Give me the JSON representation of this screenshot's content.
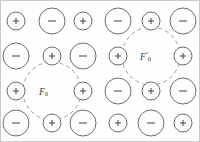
{
  "figure": {
    "background_color": "#fefefe",
    "border_color": "#c9c9c9",
    "ion_stroke_color": "#5b5b5b",
    "shell_stroke_color": "#8e8e8e",
    "label_color": "#3a3a3a",
    "width": 200,
    "height": 142
  },
  "lattice": {
    "columns_x": [
      15,
      51,
      82,
      117,
      150,
      182
    ],
    "rows_y": [
      20,
      55,
      90,
      122
    ],
    "radius_positive": 9,
    "radius_negative": 13,
    "sign_positive": "+",
    "sign_negative": "−",
    "ions": [
      {
        "row": 0,
        "col": 0,
        "charge": "positive",
        "cx": 15,
        "cy": 20,
        "r": 9,
        "sign": "+"
      },
      {
        "row": 0,
        "col": 1,
        "charge": "negative",
        "cx": 51,
        "cy": 20,
        "r": 13,
        "sign": "−"
      },
      {
        "row": 0,
        "col": 2,
        "charge": "positive",
        "cx": 82,
        "cy": 20,
        "r": 9,
        "sign": "+"
      },
      {
        "row": 0,
        "col": 3,
        "charge": "negative",
        "cx": 117,
        "cy": 20,
        "r": 13,
        "sign": "−"
      },
      {
        "row": 0,
        "col": 4,
        "charge": "positive",
        "cx": 150,
        "cy": 20,
        "r": 9,
        "sign": "+"
      },
      {
        "row": 0,
        "col": 5,
        "charge": "negative",
        "cx": 182,
        "cy": 20,
        "r": 13,
        "sign": "−"
      },
      {
        "row": 1,
        "col": 0,
        "charge": "negative",
        "cx": 15,
        "cy": 55,
        "r": 13,
        "sign": "−"
      },
      {
        "row": 1,
        "col": 1,
        "charge": "positive",
        "cx": 51,
        "cy": 55,
        "r": 9,
        "sign": "+"
      },
      {
        "row": 1,
        "col": 2,
        "charge": "negative",
        "cx": 82,
        "cy": 55,
        "r": 13,
        "sign": "−"
      },
      {
        "row": 1,
        "col": 3,
        "charge": "positive",
        "cx": 117,
        "cy": 55,
        "r": 9,
        "sign": "+"
      },
      {
        "row": 1,
        "col": 5,
        "charge": "positive",
        "cx": 182,
        "cy": 55,
        "r": 9,
        "sign": "+"
      },
      {
        "row": 2,
        "col": 0,
        "charge": "positive",
        "cx": 15,
        "cy": 90,
        "r": 9,
        "sign": "+"
      },
      {
        "row": 2,
        "col": 2,
        "charge": "positive",
        "cx": 82,
        "cy": 90,
        "r": 9,
        "sign": "+"
      },
      {
        "row": 2,
        "col": 3,
        "charge": "negative",
        "cx": 117,
        "cy": 90,
        "r": 13,
        "sign": "−"
      },
      {
        "row": 2,
        "col": 4,
        "charge": "positive",
        "cx": 150,
        "cy": 90,
        "r": 9,
        "sign": "+"
      },
      {
        "row": 2,
        "col": 5,
        "charge": "negative",
        "cx": 182,
        "cy": 90,
        "r": 13,
        "sign": "−"
      },
      {
        "row": 3,
        "col": 0,
        "charge": "negative",
        "cx": 15,
        "cy": 122,
        "r": 13,
        "sign": "−"
      },
      {
        "row": 3,
        "col": 1,
        "charge": "positive",
        "cx": 51,
        "cy": 122,
        "r": 9,
        "sign": "+"
      },
      {
        "row": 3,
        "col": 2,
        "charge": "negative",
        "cx": 82,
        "cy": 122,
        "r": 13,
        "sign": "−"
      },
      {
        "row": 3,
        "col": 3,
        "charge": "positive",
        "cx": 117,
        "cy": 122,
        "r": 9,
        "sign": "+"
      },
      {
        "row": 3,
        "col": 4,
        "charge": "negative",
        "cx": 150,
        "cy": 122,
        "r": 13,
        "sign": "−"
      },
      {
        "row": 3,
        "col": 5,
        "charge": "positive",
        "cx": 182,
        "cy": 122,
        "r": 9,
        "sign": "+"
      }
    ]
  },
  "shells": [
    {
      "name": "force-shell-left",
      "cx": 51,
      "cy": 90,
      "r": 29,
      "label_base": "F",
      "label_prime": "",
      "label_sub": "0",
      "label_x": 38,
      "label_y": 85
    },
    {
      "name": "force-shell-right",
      "cx": 150,
      "cy": 55,
      "r": 29,
      "label_base": "F",
      "label_prime": "′",
      "label_sub": "0",
      "label_x": 139,
      "label_y": 50
    }
  ]
}
